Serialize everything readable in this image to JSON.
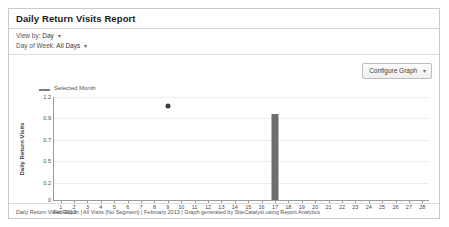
{
  "report": {
    "title": "Daily Return Visits Report",
    "controls": {
      "view_by_label": "View by:",
      "view_by_value": "Day",
      "day_of_week_label": "Day of Week:",
      "day_of_week_value": "All Days",
      "caret": "▾"
    },
    "configure_button": {
      "label": "Configure Graph",
      "caret": "▾"
    },
    "footer": "Daily Return Visits Report | All Visits (No Segment) | February 2013 | Graph generated by SiteCatalyst using Report Analytics",
    "colors": {
      "bar": "#6e6e6e",
      "point": "#3a3a3a",
      "legend_swatch": "#7d7d7d",
      "axis": "#9a9a9a",
      "grid": "#ececec",
      "panel_border": "#c9c9c9"
    }
  },
  "chart_data": {
    "type": "bar",
    "title": "Daily Return Visits Report",
    "xlabel": "Feb 2013",
    "ylabel": "Daily Return Visits",
    "legend": [
      {
        "name": "Selected Month",
        "marker": "line"
      }
    ],
    "legend_position": "top-left",
    "grid": true,
    "ylim": [
      0,
      1.2
    ],
    "ytick_labels": [
      "1.2",
      "0.9",
      "0.7",
      "0.5",
      "0.2",
      "0"
    ],
    "ytick_values": [
      1.2,
      0.95,
      0.7,
      0.45,
      0.2,
      0
    ],
    "categories": [
      "1",
      "2",
      "3",
      "4",
      "5",
      "6",
      "7",
      "8",
      "9",
      "10",
      "11",
      "12",
      "13",
      "14",
      "15",
      "16",
      "17",
      "18",
      "19",
      "20",
      "21",
      "22",
      "23",
      "24",
      "25",
      "26",
      "27",
      "28"
    ],
    "values": [
      0,
      0,
      0,
      0,
      0,
      0,
      0,
      0,
      0,
      0,
      0,
      0,
      0,
      0,
      0,
      0,
      1.0,
      0,
      0,
      0,
      0,
      0,
      0,
      0,
      0,
      0,
      0,
      0
    ],
    "points": [
      {
        "x": "9",
        "y": 1.1
      }
    ]
  }
}
